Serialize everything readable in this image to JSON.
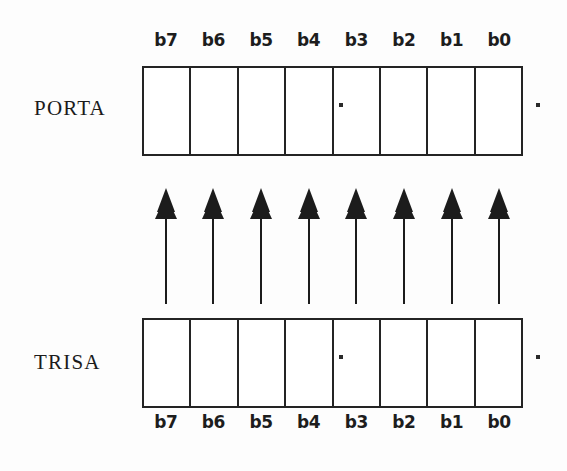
{
  "diagram": {
    "background_color": "#fdfdfd",
    "ink_color": "#242424"
  },
  "registers": [
    {
      "id": "porta",
      "name": "PORTA",
      "position": "top",
      "cell_count": 8,
      "bit_labels": [
        "b7",
        "b6",
        "b5",
        "b4",
        "b3",
        "b2",
        "b1",
        "b0"
      ],
      "label_position": "above"
    },
    {
      "id": "trisa",
      "name": "TRISA",
      "position": "bottom",
      "cell_count": 8,
      "bit_labels": [
        "b7",
        "b6",
        "b5",
        "b4",
        "b3",
        "b2",
        "b1",
        "b0"
      ],
      "label_position": "below"
    }
  ],
  "arrows": {
    "count": 8,
    "direction": "up",
    "from": "TRISA",
    "to": "PORTA",
    "color": "#1c1c1c",
    "head_style": "layered-solid-triangle"
  },
  "artifacts": {
    "speck_color": "#2a2a2a",
    "specks": [
      {
        "id": "porta-inner-speck",
        "near": "porta-divider-b4-b3"
      },
      {
        "id": "porta-outer-speck",
        "near": "porta-right-edge"
      },
      {
        "id": "trisa-inner-speck",
        "near": "trisa-divider-b4-b3"
      },
      {
        "id": "trisa-outer-speck",
        "near": "trisa-right-edge"
      }
    ]
  }
}
